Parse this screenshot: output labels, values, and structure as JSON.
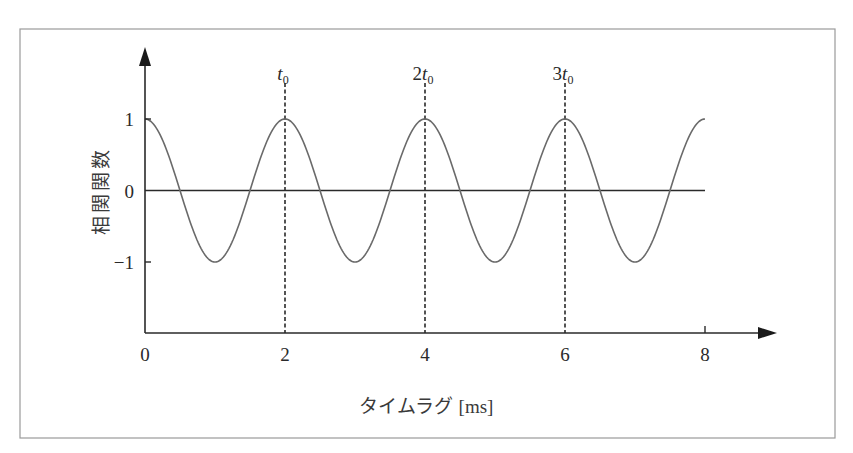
{
  "chart_data": {
    "type": "line",
    "title": "",
    "xlabel": "タイムラグ [ms]",
    "ylabel": "相関関数",
    "xlim": [
      0,
      8
    ],
    "ylim": [
      -1,
      1
    ],
    "x_ticks": [
      0,
      2,
      4,
      6,
      8
    ],
    "x_tick_labels": [
      "0",
      "2",
      "4",
      "6",
      "8"
    ],
    "y_ticks": [
      1,
      0,
      -1
    ],
    "y_tick_labels": [
      "1",
      "0",
      "−1"
    ],
    "grid": false,
    "legend": "none",
    "series": [
      {
        "name": "autocorrelation",
        "function": "cos(pi * x)",
        "period_ms": 2,
        "x": [
          0,
          0.5,
          1,
          1.5,
          2,
          2.5,
          3,
          3.5,
          4,
          4.5,
          5,
          5.5,
          6,
          6.5,
          7,
          7.5,
          8
        ],
        "y": [
          1,
          0,
          -1,
          0,
          1,
          0,
          -1,
          0,
          1,
          0,
          -1,
          0,
          1,
          0,
          -1,
          0,
          1
        ]
      }
    ],
    "reference_lines": [
      {
        "x": 2,
        "label_main": "t",
        "label_prefix": "",
        "label_sub": "0",
        "style": "dashed"
      },
      {
        "x": 4,
        "label_main": "t",
        "label_prefix": "2",
        "label_sub": "0",
        "style": "dashed"
      },
      {
        "x": 6,
        "label_main": "t",
        "label_prefix": "3",
        "label_sub": "0",
        "style": "dashed"
      }
    ],
    "zero_line": {
      "y": 0,
      "x_range": [
        0,
        8
      ]
    }
  }
}
